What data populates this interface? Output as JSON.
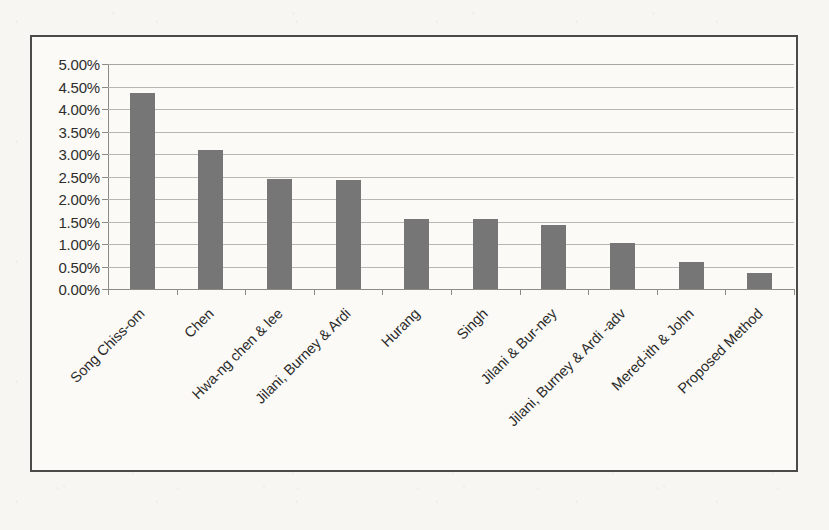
{
  "chart_data": {
    "type": "bar",
    "title": "",
    "subtitle": "",
    "xlabel": "",
    "ylabel": "",
    "ylim": [
      0,
      5
    ],
    "ytick_step": 0.5,
    "grid": true,
    "legend": false,
    "value_format": "percent",
    "bar_color": "#767676",
    "categories": [
      "Song Chiss-om",
      "Chen",
      "Hwa-ng chen & lee",
      "Jilani, Burney & Ardi",
      "Hurang",
      "Singh",
      "Jilani & Bur-ney",
      "Jilani, Burney & Ardi -adv",
      "Mered-ith & John",
      "Proposed Method"
    ],
    "values": [
      4.35,
      3.1,
      2.45,
      2.43,
      1.55,
      1.55,
      1.43,
      1.03,
      0.6,
      0.35
    ],
    "ytick_labels": [
      "5.00%",
      "4.50%",
      "4.00%",
      "3.50%",
      "3.00%",
      "2.50%",
      "2.00%",
      "1.50%",
      "1.00%",
      "0.50%",
      "0.00%"
    ],
    "ytick_values": [
      5.0,
      4.5,
      4.0,
      3.5,
      3.0,
      2.5,
      2.0,
      1.5,
      1.0,
      0.5,
      0.0
    ]
  }
}
